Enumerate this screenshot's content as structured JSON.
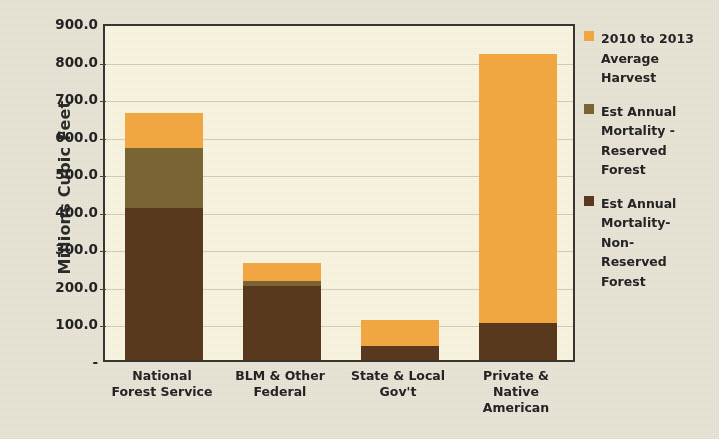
{
  "chart_data": {
    "type": "bar",
    "stacked": true,
    "title": "",
    "xlabel": "",
    "ylabel": "Millions Cubic Feet",
    "ylim": [
      0,
      900
    ],
    "ytick_labels": [
      "900.0",
      "800.0",
      "700.0",
      "600.0",
      "500.0",
      "400.0",
      "300.0",
      "200.0",
      "100.0",
      "-"
    ],
    "ytick_values": [
      900,
      800,
      700,
      600,
      500,
      400,
      300,
      200,
      100,
      0
    ],
    "grid": true,
    "legend_position": "right",
    "categories": [
      "National\nForest Service",
      "BLM & Other\nFederal",
      "State & Local\nGov't",
      "Private &\nNative\nAmerican"
    ],
    "series": [
      {
        "name": "Est Annual\nMortality-\nNon-\nReserved\nForest",
        "color": "#5A3A1E",
        "values": [
          405,
          197,
          37,
          98
        ]
      },
      {
        "name": "Est Annual\nMortality -\nReserved\nForest",
        "color": "#7C6534",
        "values": [
          160,
          13,
          0,
          0
        ]
      },
      {
        "name": "2010 to 2013\nAverage\nHarvest",
        "color": "#F5A942",
        "values": [
          93,
          48,
          70,
          716
        ]
      }
    ],
    "totals": [
      658,
      258,
      107,
      814
    ],
    "legend_order": [
      "2010 to 2013\nAverage\nHarvest",
      "Est Annual\nMortality -\nReserved\nForest",
      "Est Annual\nMortality-\nNon-\nReserved\nForest"
    ],
    "colors": {
      "harvest": "#F5A942",
      "mortality_reserved": "#7C6534",
      "mortality_non_reserved": "#5A3A1E",
      "plot_background": "#FBF6E2",
      "figure_background": "#E9E5D7",
      "axis": "#3A3630"
    }
  },
  "legend": [
    {
      "label": "2010 to 2013\nAverage\nHarvest",
      "color": "#F5A942",
      "icon": "square-swatch-icon"
    },
    {
      "label": "Est Annual\nMortality -\nReserved\nForest",
      "color": "#7C6534",
      "icon": "square-swatch-icon"
    },
    {
      "label": "Est Annual\nMortality-\nNon-\nReserved\nForest",
      "color": "#5A3A1E",
      "icon": "square-swatch-icon"
    }
  ]
}
